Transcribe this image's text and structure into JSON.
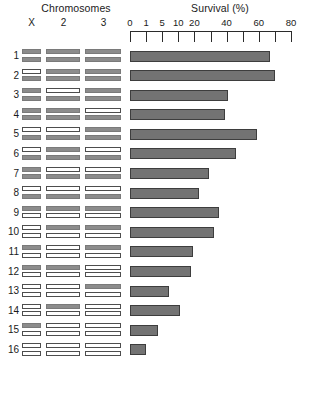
{
  "header": {
    "chromosomes_title": "Chromosomes",
    "survival_title": "Survival (%)",
    "chromosome_columns": [
      {
        "label": "X"
      },
      {
        "label": "2"
      },
      {
        "label": "3"
      }
    ]
  },
  "axis": {
    "tick_labels": [
      "0",
      "1",
      "5",
      "10",
      "20",
      "",
      "40",
      "",
      "60",
      "",
      "80"
    ],
    "tick_values": [
      0,
      1,
      5,
      10,
      20,
      30,
      40,
      50,
      60,
      70,
      80
    ],
    "axis_left_px": 130,
    "tick_spacing_px": 16.1
  },
  "legend_colors": {
    "filled_chromosome": "#8c8c8c",
    "open_chromosome": "#ffffff",
    "bar_fill": "#737373",
    "bar_outline": "#3d3d3d",
    "text": "#1a1a1a"
  },
  "chart_data": {
    "type": "bar",
    "title": "Survival (%)",
    "xlabel": "Survival (%)",
    "ylabel": "",
    "orientation": "horizontal",
    "xscale": "custom-nonlinear",
    "xlim": [
      0,
      80
    ],
    "xticks": [
      0,
      1,
      5,
      10,
      20,
      30,
      40,
      50,
      60,
      70,
      80
    ],
    "xticklabels": [
      "0",
      "1",
      "5",
      "10",
      "20",
      "",
      "40",
      "",
      "60",
      "",
      "80"
    ],
    "grid": false,
    "legend": "none",
    "categories": [
      "1",
      "2",
      "3",
      "4",
      "5",
      "6",
      "7",
      "8",
      "9",
      "10",
      "11",
      "12",
      "13",
      "14",
      "15",
      "16"
    ],
    "values": [
      67,
      70,
      41,
      39,
      59,
      46,
      29,
      23,
      35,
      32,
      19,
      18,
      7,
      11,
      4,
      1
    ]
  },
  "rows": [
    {
      "label": "1",
      "X": [
        "filled",
        "filled"
      ],
      "c2": [
        "filled",
        "filled"
      ],
      "c3": [
        "filled",
        "filled"
      ],
      "survival": 67
    },
    {
      "label": "2",
      "X": [
        "open",
        "filled"
      ],
      "c2": [
        "filled",
        "filled"
      ],
      "c3": [
        "filled",
        "filled"
      ],
      "survival": 70
    },
    {
      "label": "3",
      "X": [
        "filled",
        "filled"
      ],
      "c2": [
        "open",
        "filled"
      ],
      "c3": [
        "filled",
        "filled"
      ],
      "survival": 41
    },
    {
      "label": "4",
      "X": [
        "filled",
        "filled"
      ],
      "c2": [
        "filled",
        "filled"
      ],
      "c3": [
        "open",
        "filled"
      ],
      "survival": 39
    },
    {
      "label": "5",
      "X": [
        "open",
        "filled"
      ],
      "c2": [
        "open",
        "filled"
      ],
      "c3": [
        "filled",
        "filled"
      ],
      "survival": 59
    },
    {
      "label": "6",
      "X": [
        "open",
        "filled"
      ],
      "c2": [
        "filled",
        "filled"
      ],
      "c3": [
        "open",
        "filled"
      ],
      "survival": 46
    },
    {
      "label": "7",
      "X": [
        "filled",
        "filled"
      ],
      "c2": [
        "open",
        "filled"
      ],
      "c3": [
        "open",
        "filled"
      ],
      "survival": 29
    },
    {
      "label": "8",
      "X": [
        "open",
        "filled"
      ],
      "c2": [
        "open",
        "filled"
      ],
      "c3": [
        "open",
        "filled"
      ],
      "survival": 23
    },
    {
      "label": "9",
      "X": [
        "filled",
        "open"
      ],
      "c2": [
        "filled",
        "open"
      ],
      "c3": [
        "filled",
        "open"
      ],
      "survival": 35
    },
    {
      "label": "10",
      "X": [
        "open",
        "open"
      ],
      "c2": [
        "filled",
        "open"
      ],
      "c3": [
        "filled",
        "open"
      ],
      "survival": 32
    },
    {
      "label": "11",
      "X": [
        "filled",
        "open"
      ],
      "c2": [
        "open",
        "open"
      ],
      "c3": [
        "filled",
        "open"
      ],
      "survival": 19
    },
    {
      "label": "12",
      "X": [
        "filled",
        "open"
      ],
      "c2": [
        "filled",
        "open"
      ],
      "c3": [
        "open",
        "open"
      ],
      "survival": 18
    },
    {
      "label": "13",
      "X": [
        "open",
        "open"
      ],
      "c2": [
        "open",
        "open"
      ],
      "c3": [
        "filled",
        "open"
      ],
      "survival": 7
    },
    {
      "label": "14",
      "X": [
        "open",
        "open"
      ],
      "c2": [
        "filled",
        "open"
      ],
      "c3": [
        "open",
        "open"
      ],
      "survival": 11
    },
    {
      "label": "15",
      "X": [
        "filled",
        "open"
      ],
      "c2": [
        "open",
        "open"
      ],
      "c3": [
        "open",
        "open"
      ],
      "survival": 4
    },
    {
      "label": "16",
      "X": [
        "open",
        "open"
      ],
      "c2": [
        "open",
        "open"
      ],
      "c3": [
        "open",
        "open"
      ],
      "survival": 1
    }
  ]
}
